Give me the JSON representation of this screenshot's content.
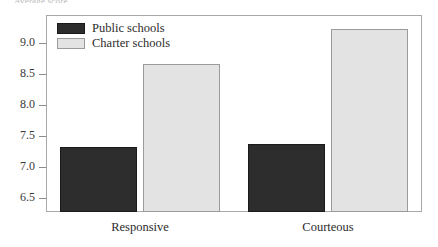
{
  "top_caption": "Average score",
  "chart_data": {
    "type": "bar",
    "title": "",
    "xlabel": "",
    "ylabel": "",
    "categories": [
      "Responsive",
      "Courteous"
    ],
    "series": [
      {
        "name": "Public schools",
        "color": "#2d2d2d",
        "values": [
          7.33,
          7.38
        ]
      },
      {
        "name": "Charter schools",
        "color": "#e3e3e3",
        "values": [
          8.66,
          9.22
        ]
      }
    ],
    "ylim": [
      6.28,
      9.45
    ],
    "yticks": [
      6.5,
      7.0,
      7.5,
      8.0,
      8.5,
      9.0
    ],
    "ytick_labels": [
      "6.5",
      "7.0",
      "7.5",
      "8.0",
      "8.5",
      "9.0"
    ],
    "grid": false,
    "legend_position": "top-left",
    "frame": true
  },
  "legend": {
    "items": [
      {
        "label": "Public schools",
        "swatch": "public"
      },
      {
        "label": "Charter schools",
        "swatch": "charter"
      }
    ]
  }
}
